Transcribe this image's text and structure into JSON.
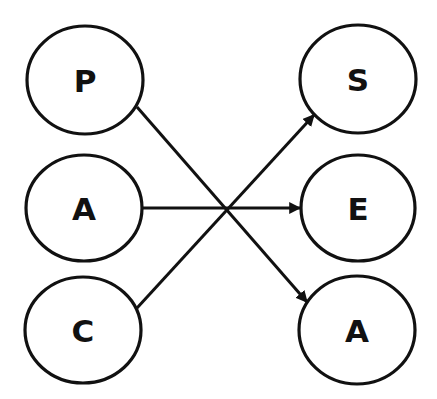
{
  "diagram": {
    "type": "bipartite-mapping",
    "colors": {
      "stroke": "#111111",
      "background": "#ffffff",
      "node_fill": "#ffffff"
    },
    "nodes": [
      {
        "id": "left-p",
        "label": "P",
        "cx": 85,
        "cy": 80,
        "rx": 58,
        "ry": 54
      },
      {
        "id": "left-a",
        "label": "A",
        "cx": 84,
        "cy": 208,
        "rx": 58,
        "ry": 53
      },
      {
        "id": "left-c",
        "label": "C",
        "cx": 83,
        "cy": 330,
        "rx": 58,
        "ry": 53
      },
      {
        "id": "right-s",
        "label": "S",
        "cx": 358,
        "cy": 79,
        "rx": 58,
        "ry": 54
      },
      {
        "id": "right-e",
        "label": "E",
        "cx": 358,
        "cy": 208,
        "rx": 57,
        "ry": 53
      },
      {
        "id": "right-a",
        "label": "A",
        "cx": 357,
        "cy": 330,
        "rx": 58,
        "ry": 54
      }
    ],
    "edges": [
      {
        "from": "P",
        "to": "A",
        "x1": 137,
        "y1": 107,
        "x2": 307,
        "y2": 302
      },
      {
        "from": "A",
        "to": "E",
        "x1": 142,
        "y1": 208,
        "x2": 300,
        "y2": 208
      },
      {
        "from": "C",
        "to": "S",
        "x1": 137,
        "y1": 308,
        "x2": 314,
        "y2": 115
      }
    ]
  }
}
